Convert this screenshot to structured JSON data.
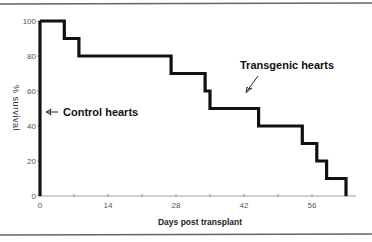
{
  "chart_data": {
    "type": "line",
    "step": true,
    "title": "",
    "xlabel": "Days post transplant",
    "ylabel": "% survival",
    "xlim": [
      0,
      65
    ],
    "ylim": [
      0,
      100
    ],
    "x_ticks": [
      0,
      14,
      28,
      42,
      56
    ],
    "x_minor_ticks": [
      7,
      21,
      35,
      49,
      63
    ],
    "y_ticks": [
      0,
      20,
      40,
      60,
      80,
      100
    ],
    "grid": false,
    "legend": "none",
    "series": [
      {
        "name": "Control hearts",
        "x": [
          0,
          0
        ],
        "y": [
          100,
          0
        ]
      },
      {
        "name": "Transgenic hearts",
        "x": [
          0,
          5,
          5,
          8,
          8,
          27,
          27,
          34,
          34,
          35,
          35,
          45,
          45,
          54,
          54,
          57,
          57,
          59,
          59,
          63,
          63
        ],
        "y": [
          100,
          100,
          90,
          90,
          80,
          80,
          70,
          70,
          60,
          60,
          50,
          50,
          40,
          40,
          30,
          30,
          20,
          20,
          10,
          10,
          0
        ]
      }
    ],
    "annotations": [
      {
        "text": "Control hearts",
        "arrow_to": "Control hearts series at ~50%"
      },
      {
        "text": "Transgenic hearts",
        "arrow_to": "Transgenic hearts series at ~day 42, 50%"
      }
    ]
  },
  "labels": {
    "xlabel": "Days post transplant",
    "ylabel": "% survival",
    "control": "Control hearts",
    "transgenic": "Transgenic hearts",
    "x_ticks": [
      "0",
      "14",
      "28",
      "42",
      "56"
    ],
    "y_ticks": [
      "0",
      "20",
      "40",
      "60",
      "80",
      "100"
    ]
  }
}
